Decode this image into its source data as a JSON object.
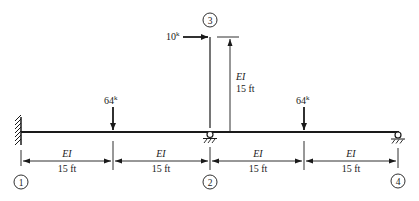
{
  "diagram": {
    "type": "structural-frame",
    "nodes": [
      {
        "id": "1",
        "label": "1",
        "support": "fixed"
      },
      {
        "id": "2",
        "label": "2",
        "support": "pin"
      },
      {
        "id": "3",
        "label": "3",
        "support": "free"
      },
      {
        "id": "4",
        "label": "4",
        "support": "roller"
      }
    ],
    "loads": [
      {
        "name": "load-left",
        "magnitude": "64",
        "unit": "k",
        "direction": "down"
      },
      {
        "name": "load-right",
        "magnitude": "64",
        "unit": "k",
        "direction": "down"
      },
      {
        "name": "load-horizontal",
        "magnitude": "10",
        "unit": "k",
        "direction": "right"
      }
    ],
    "members": [
      {
        "name": "span-1",
        "stiffness": "EI",
        "length": "15 ft"
      },
      {
        "name": "span-2",
        "stiffness": "EI",
        "length": "15 ft"
      },
      {
        "name": "span-3",
        "stiffness": "EI",
        "length": "15 ft"
      },
      {
        "name": "span-4",
        "stiffness": "EI",
        "length": "15 ft"
      },
      {
        "name": "column",
        "stiffness": "EI",
        "length": "15 ft"
      }
    ]
  }
}
